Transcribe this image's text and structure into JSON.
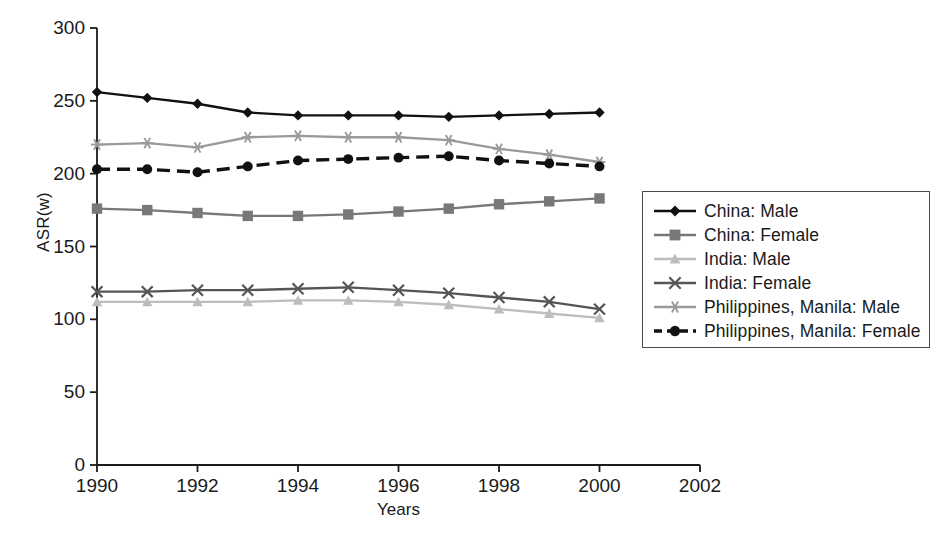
{
  "chart_data": {
    "type": "line",
    "title": "",
    "xlabel": "Years",
    "ylabel": "ASR(w)",
    "xlim": [
      1990,
      2002
    ],
    "ylim": [
      0,
      300
    ],
    "ytick_values": [
      0,
      50,
      100,
      150,
      200,
      250,
      300
    ],
    "ytick_labels": [
      "0",
      "50",
      "100",
      "150",
      "200",
      "250",
      "300"
    ],
    "xtick_values": [
      1990,
      1992,
      1994,
      1996,
      1998,
      2000,
      2002
    ],
    "xtick_labels": [
      "1990",
      "1992",
      "1994",
      "1996",
      "1998",
      "2000",
      "2002"
    ],
    "x": [
      1990,
      1991,
      1992,
      1993,
      1994,
      1995,
      1996,
      1997,
      1998,
      1999,
      2000
    ],
    "grid": false,
    "legend_position": "right",
    "series": [
      {
        "name": "China: Male",
        "marker": "diamond",
        "color": "#111111",
        "dash": "none",
        "values": [
          256,
          252,
          248,
          242,
          240,
          240,
          240,
          239,
          240,
          241,
          242
        ]
      },
      {
        "name": "China: Female",
        "marker": "square",
        "color": "#787878",
        "dash": "none",
        "values": [
          176,
          175,
          173,
          171,
          171,
          172,
          174,
          176,
          179,
          181,
          183
        ]
      },
      {
        "name": "India: Male",
        "marker": "triangle",
        "color": "#bdbdbd",
        "dash": "none",
        "values": [
          112,
          112,
          112,
          112,
          113,
          113,
          112,
          110,
          107,
          104,
          101
        ]
      },
      {
        "name": "India: Female",
        "marker": "x",
        "color": "#555555",
        "dash": "none",
        "values": [
          119,
          119,
          120,
          120,
          121,
          122,
          120,
          118,
          115,
          112,
          107
        ]
      },
      {
        "name": "Philippines, Manila: Male",
        "marker": "asterisk",
        "color": "#9a9a9a",
        "dash": "none",
        "values": [
          220,
          221,
          218,
          225,
          226,
          225,
          225,
          223,
          217,
          213,
          208
        ]
      },
      {
        "name": "Philippines, Manila: Female",
        "marker": "circle",
        "color": "#111111",
        "dash": "dashed",
        "values": [
          203,
          203,
          201,
          205,
          209,
          210,
          211,
          212,
          209,
          207,
          205
        ]
      }
    ]
  },
  "legend": {
    "entries": [
      {
        "label": "China: Male"
      },
      {
        "label": "China: Female"
      },
      {
        "label": "India: Male"
      },
      {
        "label": "India: Female"
      },
      {
        "label": "Philippines, Manila: Male"
      },
      {
        "label": "Philippines, Manila: Female"
      }
    ]
  }
}
